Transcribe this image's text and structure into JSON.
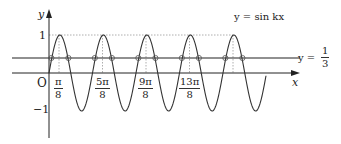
{
  "figure": {
    "function_label": "y = sin kx",
    "line_label_prefix": "y =",
    "line_label_num": "1",
    "line_label_den": "3",
    "axis_x_label": "x",
    "axis_y_label": "y",
    "origin_label": "O",
    "y_tick_1": "1",
    "y_tick_neg1": "−1",
    "x_ticks": [
      {
        "num": "π",
        "den": "8"
      },
      {
        "num": "5π",
        "den": "8"
      },
      {
        "num": "9π",
        "den": "8"
      },
      {
        "num": "13π",
        "den": "8"
      }
    ],
    "colors": {
      "curve": "#333333",
      "axis": "#222222",
      "guide": "#999999"
    }
  }
}
